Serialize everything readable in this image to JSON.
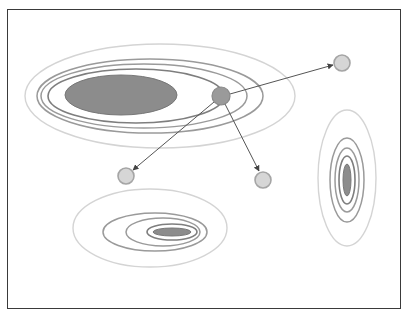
{
  "diagram": {
    "type": "gaussian-mixture-clusters-with-arrows",
    "frame": {
      "x": 7,
      "y": 9,
      "width": 394,
      "height": 300,
      "border_color": "#3a3a3a"
    },
    "colors": {
      "outer_contour": "#d4d4d4",
      "mid_contour": "#9a9a9a",
      "inner_contour": "#7e7e7e",
      "core_fill": "#8c8c8c",
      "center_node_fill": "#9a9a9a",
      "target_node_fill": "#d6d6d6",
      "edge": "#555555"
    },
    "clusters": [
      {
        "name": "large-horizontal-cluster",
        "center": [
          160,
          96
        ],
        "contours": [
          {
            "cx": 160,
            "cy": 96,
            "rx": 135,
            "ry": 52,
            "level": "outer"
          },
          {
            "cx": 150,
            "cy": 96,
            "rx": 113,
            "ry": 37,
            "level": "mid"
          },
          {
            "cx": 144,
            "cy": 96,
            "rx": 103,
            "ry": 32,
            "level": "mid"
          },
          {
            "cx": 136,
            "cy": 96,
            "rx": 88,
            "ry": 27,
            "level": "inner"
          }
        ],
        "core": {
          "cx": 121,
          "cy": 95,
          "rx": 56,
          "ry": 20
        }
      },
      {
        "name": "small-horizontal-cluster",
        "center": [
          152,
          230
        ],
        "contours": [
          {
            "cx": 150,
            "cy": 228,
            "rx": 77,
            "ry": 39,
            "level": "outer"
          },
          {
            "cx": 155,
            "cy": 232,
            "rx": 52,
            "ry": 19,
            "level": "mid"
          },
          {
            "cx": 163,
            "cy": 232,
            "rx": 37,
            "ry": 14,
            "level": "mid"
          },
          {
            "cx": 172,
            "cy": 232,
            "rx": 25,
            "ry": 8,
            "level": "inner"
          }
        ],
        "core": {
          "cx": 172,
          "cy": 232,
          "rx": 19,
          "ry": 4
        }
      },
      {
        "name": "vertical-cluster",
        "center": [
          347,
          180
        ],
        "contours": [
          {
            "cx": 347,
            "cy": 178,
            "rx": 29,
            "ry": 68,
            "level": "outer"
          },
          {
            "cx": 347,
            "cy": 180,
            "rx": 17,
            "ry": 42,
            "level": "mid"
          },
          {
            "cx": 347,
            "cy": 180,
            "rx": 12,
            "ry": 32,
            "level": "mid"
          },
          {
            "cx": 347,
            "cy": 180,
            "rx": 8,
            "ry": 24,
            "level": "inner"
          }
        ],
        "core": {
          "cx": 347,
          "cy": 180,
          "rx": 4,
          "ry": 16
        }
      }
    ],
    "nodes": {
      "center": {
        "cx": 221,
        "cy": 96,
        "r": 9
      },
      "targets": [
        {
          "name": "target-top-right",
          "cx": 342,
          "cy": 63,
          "r": 8
        },
        {
          "name": "target-bottom-left",
          "cx": 126,
          "cy": 176,
          "r": 8
        },
        {
          "name": "target-bottom-mid",
          "cx": 263,
          "cy": 180,
          "r": 8
        }
      ]
    },
    "edges": [
      {
        "from": "center",
        "to": "target-top-right",
        "x1": 230,
        "y1": 94,
        "x2": 333,
        "y2": 65
      },
      {
        "from": "center",
        "to": "target-bottom-left",
        "x1": 214,
        "y1": 102,
        "x2": 133,
        "y2": 170
      },
      {
        "from": "center",
        "to": "target-bottom-mid",
        "x1": 225,
        "y1": 104,
        "x2": 259,
        "y2": 171
      }
    ]
  }
}
